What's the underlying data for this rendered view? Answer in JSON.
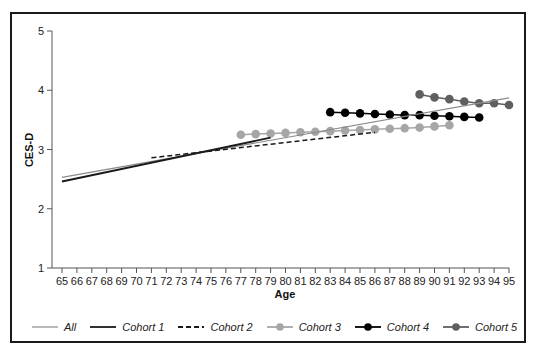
{
  "chart_data": {
    "type": "line",
    "title": "",
    "xlabel": "Age",
    "ylabel": "CES-D",
    "xlim": [
      65,
      95
    ],
    "ylim": [
      1,
      5
    ],
    "x_ticks": [
      65,
      66,
      67,
      68,
      69,
      70,
      71,
      72,
      73,
      74,
      75,
      76,
      77,
      78,
      79,
      80,
      81,
      82,
      83,
      84,
      85,
      86,
      87,
      88,
      89,
      90,
      91,
      92,
      93,
      94,
      95
    ],
    "y_ticks": [
      1,
      2,
      3,
      4,
      5
    ],
    "grid": false,
    "legend_position": "bottom",
    "series": [
      {
        "name": "All",
        "style": "thin-solid",
        "color": "#8a8a8a",
        "markers": false,
        "x": [
          65,
          95
        ],
        "y": [
          2.53,
          3.87
        ]
      },
      {
        "name": "Cohort 1",
        "style": "solid",
        "color": "#1a1a1a",
        "markers": false,
        "x": [
          65,
          79
        ],
        "y": [
          2.46,
          3.2
        ]
      },
      {
        "name": "Cohort 2",
        "style": "dashed",
        "color": "#1a1a1a",
        "markers": false,
        "x": [
          71,
          86
        ],
        "y": [
          2.86,
          3.29
        ]
      },
      {
        "name": "Cohort 3",
        "style": "solid-marker",
        "color": "#a6a6a6",
        "markers": true,
        "x": [
          77,
          78,
          79,
          80,
          81,
          82,
          83,
          84,
          85,
          86,
          87,
          88,
          89,
          90,
          91
        ],
        "y": [
          3.25,
          3.26,
          3.27,
          3.28,
          3.29,
          3.3,
          3.31,
          3.32,
          3.33,
          3.34,
          3.35,
          3.36,
          3.37,
          3.39,
          3.41
        ]
      },
      {
        "name": "Cohort 4",
        "style": "solid-marker",
        "color": "#000000",
        "markers": true,
        "x": [
          83,
          84,
          85,
          86,
          87,
          88,
          89,
          90,
          91,
          92,
          93
        ],
        "y": [
          3.63,
          3.62,
          3.61,
          3.6,
          3.59,
          3.58,
          3.58,
          3.57,
          3.56,
          3.55,
          3.54
        ]
      },
      {
        "name": "Cohort 5",
        "style": "solid-marker",
        "color": "#5f5f5f",
        "markers": true,
        "x": [
          89,
          90,
          91,
          92,
          93,
          94,
          95
        ],
        "y": [
          3.93,
          3.88,
          3.85,
          3.81,
          3.78,
          3.78,
          3.75
        ]
      }
    ]
  },
  "legend": {
    "items": [
      {
        "label": "All",
        "color": "#8a8a8a",
        "style": "thin-solid"
      },
      {
        "label": "Cohort 1",
        "color": "#1a1a1a",
        "style": "solid"
      },
      {
        "label": "Cohort 2",
        "color": "#1a1a1a",
        "style": "dashed"
      },
      {
        "label": "Cohort 3",
        "color": "#a6a6a6",
        "style": "marker"
      },
      {
        "label": "Cohort 4",
        "color": "#000000",
        "style": "marker"
      },
      {
        "label": "Cohort 5",
        "color": "#5f5f5f",
        "style": "marker"
      }
    ]
  }
}
